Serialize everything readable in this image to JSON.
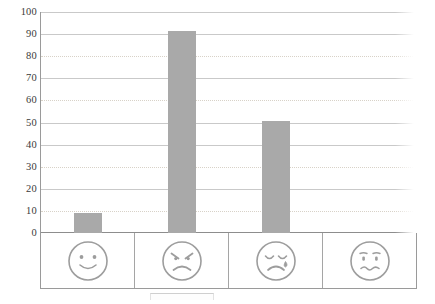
{
  "chart_data": {
    "type": "bar",
    "title": "",
    "xlabel": "",
    "ylabel": "",
    "ylim": [
      0,
      100
    ],
    "yticks": [
      0,
      10,
      20,
      30,
      40,
      50,
      60,
      70,
      80,
      90,
      100
    ],
    "grid": true,
    "legend_position": "none",
    "categories": [
      "happy-face",
      "angry-face",
      "sad-crying-face",
      "worried-face"
    ],
    "category_labels": [
      "Happy",
      "Angry",
      "Sad",
      "Worried"
    ],
    "values": [
      9,
      92,
      51,
      0
    ],
    "series": [
      {
        "name": "responses",
        "values": [
          9,
          92,
          51,
          0
        ]
      }
    ],
    "bar_color": "#a9a9a9",
    "gridline_color": "#c9c9c9",
    "axis_color": "#9a9a9a",
    "tick_label_color": "#3a3a3a"
  },
  "axis": {
    "y_tick_labels": [
      "100",
      "90",
      "80",
      "70",
      "60",
      "50",
      "40",
      "30",
      "20",
      "10",
      "0"
    ]
  },
  "faces": [
    {
      "name": "happy-face-icon",
      "mood": "happy"
    },
    {
      "name": "angry-face-icon",
      "mood": "angry"
    },
    {
      "name": "sad-crying-face-icon",
      "mood": "sad"
    },
    {
      "name": "worried-face-icon",
      "mood": "worried"
    }
  ]
}
